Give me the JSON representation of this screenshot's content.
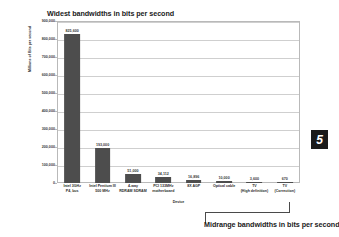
{
  "figure": {
    "title": "Widest bandwidths in bits per second",
    "caption": "Midrange bandwidths in bits per second",
    "page_badge": "5"
  },
  "chart_data": {
    "type": "bar",
    "title": "Widest bandwidths in bits per second",
    "xlabel": "Device",
    "ylabel": "Millions of Bits per second",
    "ylim": [
      0,
      900000
    ],
    "grid": true,
    "legend": "none",
    "bar_color": "#4d4d4d",
    "categories": [
      "Intel 3GHz P4, bus",
      "Intel Pentium III 500 MHz",
      "4-way RDRAM SDRAM",
      "PCI 133MHz motherboard",
      "8X AGP",
      "Optical cable",
      "TV (High definition)",
      "TV (Correction)"
    ],
    "category_lines": [
      [
        "Intel 3GHz",
        "P4, bus"
      ],
      [
        "Intel Pentium III",
        "500 MHz"
      ],
      [
        "4-way",
        "RDRAM SDRAM"
      ],
      [
        "PCI 133MHz",
        "motherboard"
      ],
      [
        "8X AGP",
        ""
      ],
      [
        "Optical cable",
        ""
      ],
      [
        "TV",
        "(High definition)"
      ],
      [
        "TV",
        "(Correction)"
      ]
    ],
    "values": [
      825600,
      193000,
      51000,
      34112,
      16896,
      10000,
      3600,
      670
    ],
    "value_labels": [
      "825,600",
      "193,000",
      "51,000",
      "34,112",
      "16,896",
      "10,000",
      "3,600",
      "670"
    ],
    "y_ticks": [
      900000,
      800000,
      700000,
      600000,
      500000,
      400000,
      300000,
      200000,
      100000,
      0
    ],
    "y_tick_labels": [
      "900,000",
      "800,000",
      "700,000",
      "600,000",
      "500,000",
      "400,000",
      "300,000",
      "200,000",
      "100,000",
      "0"
    ]
  }
}
